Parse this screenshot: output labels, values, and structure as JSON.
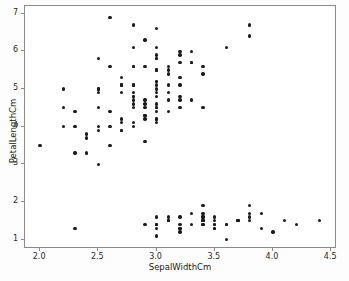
{
  "chart_data": {
    "type": "scatter",
    "title": "",
    "xlabel": "SepalWidthCm",
    "ylabel": "PetalLengthCm",
    "xlim": [
      1.87,
      4.55
    ],
    "ylim": [
      0.75,
      7.2
    ],
    "xticks": [
      "2.0",
      "2.5",
      "3.0",
      "3.5",
      "4.0",
      "4.5"
    ],
    "xtick_values": [
      2.0,
      2.5,
      3.0,
      3.5,
      4.0,
      4.5
    ],
    "yticks": [
      "1",
      "2",
      "3",
      "4",
      "5",
      "6",
      "7"
    ],
    "ytick_values": [
      1,
      2,
      3,
      4,
      5,
      6,
      7
    ],
    "grid": false,
    "legend": "none",
    "marker_color": "#1b1b1b",
    "marker_size": 3.4,
    "points": [
      [
        3.5,
        1.4
      ],
      [
        3.0,
        1.4
      ],
      [
        3.2,
        1.3
      ],
      [
        3.1,
        1.5
      ],
      [
        3.6,
        1.4
      ],
      [
        3.9,
        1.7
      ],
      [
        3.4,
        1.4
      ],
      [
        3.4,
        1.5
      ],
      [
        2.9,
        1.4
      ],
      [
        3.1,
        1.5
      ],
      [
        3.7,
        1.5
      ],
      [
        3.4,
        1.6
      ],
      [
        3.0,
        1.4
      ],
      [
        3.0,
        1.1
      ],
      [
        4.0,
        1.2
      ],
      [
        4.4,
        1.5
      ],
      [
        3.9,
        1.3
      ],
      [
        3.5,
        1.4
      ],
      [
        3.8,
        1.7
      ],
      [
        3.8,
        1.5
      ],
      [
        3.4,
        1.7
      ],
      [
        3.7,
        1.5
      ],
      [
        3.6,
        1.0
      ],
      [
        3.3,
        1.7
      ],
      [
        3.4,
        1.9
      ],
      [
        3.0,
        1.6
      ],
      [
        3.4,
        1.6
      ],
      [
        3.5,
        1.5
      ],
      [
        3.4,
        1.4
      ],
      [
        3.2,
        1.6
      ],
      [
        3.1,
        1.6
      ],
      [
        3.4,
        1.5
      ],
      [
        4.1,
        1.5
      ],
      [
        4.2,
        1.4
      ],
      [
        3.1,
        1.5
      ],
      [
        3.2,
        1.2
      ],
      [
        3.5,
        1.3
      ],
      [
        3.6,
        1.4
      ],
      [
        3.0,
        1.3
      ],
      [
        3.4,
        1.5
      ],
      [
        3.5,
        1.3
      ],
      [
        2.3,
        1.3
      ],
      [
        3.2,
        1.3
      ],
      [
        3.5,
        1.6
      ],
      [
        3.8,
        1.9
      ],
      [
        3.0,
        1.4
      ],
      [
        3.8,
        1.6
      ],
      [
        3.2,
        1.4
      ],
      [
        3.7,
        1.5
      ],
      [
        3.3,
        1.4
      ],
      [
        3.2,
        4.7
      ],
      [
        3.2,
        4.5
      ],
      [
        3.1,
        4.9
      ],
      [
        2.3,
        4.0
      ],
      [
        2.8,
        4.6
      ],
      [
        2.8,
        4.5
      ],
      [
        3.3,
        4.7
      ],
      [
        2.4,
        3.3
      ],
      [
        2.9,
        4.6
      ],
      [
        2.7,
        3.9
      ],
      [
        2.0,
        3.5
      ],
      [
        3.0,
        4.2
      ],
      [
        2.2,
        4.0
      ],
      [
        2.9,
        4.7
      ],
      [
        2.9,
        3.6
      ],
      [
        3.1,
        4.4
      ],
      [
        3.0,
        4.5
      ],
      [
        2.7,
        4.1
      ],
      [
        2.2,
        4.5
      ],
      [
        2.5,
        3.9
      ],
      [
        3.2,
        4.8
      ],
      [
        2.8,
        4.0
      ],
      [
        2.5,
        4.9
      ],
      [
        2.8,
        4.7
      ],
      [
        2.9,
        4.3
      ],
      [
        3.0,
        4.4
      ],
      [
        2.8,
        4.8
      ],
      [
        3.0,
        5.0
      ],
      [
        2.9,
        4.5
      ],
      [
        2.6,
        3.5
      ],
      [
        2.4,
        3.8
      ],
      [
        2.4,
        3.7
      ],
      [
        2.7,
        3.9
      ],
      [
        2.7,
        5.1
      ],
      [
        3.0,
        4.5
      ],
      [
        3.4,
        4.5
      ],
      [
        3.1,
        4.7
      ],
      [
        2.3,
        4.4
      ],
      [
        3.0,
        4.1
      ],
      [
        2.5,
        4.0
      ],
      [
        2.6,
        4.4
      ],
      [
        3.0,
        4.6
      ],
      [
        2.6,
        4.0
      ],
      [
        2.3,
        3.3
      ],
      [
        2.7,
        4.2
      ],
      [
        3.0,
        4.2
      ],
      [
        2.9,
        4.2
      ],
      [
        2.9,
        4.3
      ],
      [
        2.5,
        3.0
      ],
      [
        2.8,
        4.1
      ],
      [
        3.3,
        6.0
      ],
      [
        2.7,
        5.1
      ],
      [
        3.0,
        5.9
      ],
      [
        2.9,
        5.6
      ],
      [
        3.0,
        5.8
      ],
      [
        3.0,
        6.6
      ],
      [
        2.5,
        4.5
      ],
      [
        2.9,
        6.3
      ],
      [
        2.5,
        5.8
      ],
      [
        3.6,
        6.1
      ],
      [
        3.2,
        5.1
      ],
      [
        2.7,
        5.3
      ],
      [
        3.0,
        5.5
      ],
      [
        2.5,
        5.0
      ],
      [
        2.8,
        5.1
      ],
      [
        3.2,
        5.3
      ],
      [
        3.0,
        5.5
      ],
      [
        3.8,
        6.7
      ],
      [
        2.6,
        6.9
      ],
      [
        2.2,
        5.0
      ],
      [
        3.2,
        5.7
      ],
      [
        2.8,
        4.9
      ],
      [
        2.8,
        6.7
      ],
      [
        2.7,
        4.9
      ],
      [
        3.3,
        5.7
      ],
      [
        3.2,
        6.0
      ],
      [
        2.8,
        4.8
      ],
      [
        3.0,
        4.9
      ],
      [
        2.8,
        5.6
      ],
      [
        3.0,
        5.8
      ],
      [
        2.8,
        6.1
      ],
      [
        3.8,
        6.4
      ],
      [
        2.8,
        5.6
      ],
      [
        2.8,
        5.1
      ],
      [
        2.6,
        5.6
      ],
      [
        3.0,
        6.1
      ],
      [
        3.4,
        5.6
      ],
      [
        3.1,
        5.5
      ],
      [
        3.0,
        4.8
      ],
      [
        3.1,
        5.4
      ],
      [
        3.1,
        5.6
      ],
      [
        3.1,
        5.1
      ],
      [
        2.7,
        5.1
      ],
      [
        3.2,
        5.9
      ],
      [
        3.3,
        5.7
      ],
      [
        3.0,
        5.2
      ],
      [
        2.5,
        5.0
      ],
      [
        3.0,
        5.2
      ],
      [
        3.4,
        5.4
      ],
      [
        3.0,
        5.1
      ]
    ]
  }
}
